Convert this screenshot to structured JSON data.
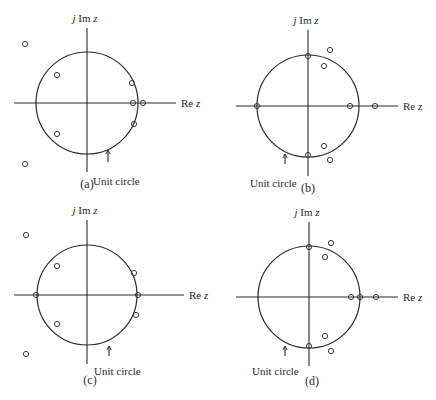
{
  "figure": {
    "panels": [
      {
        "id": "a",
        "caption": "(a)",
        "center": [
          87,
          103
        ],
        "radius": 51,
        "re_axis": [
          14,
          176
        ],
        "im_axis": [
          28,
          172
        ],
        "im_label": "j Im z",
        "re_label": "Re z",
        "unit_circle_label": "Unit circle",
        "unit_circle_label_pos": [
          93,
          176
        ],
        "arrow_x": 108,
        "arrow_y": [
          150,
          162
        ],
        "caption_pos": [
          87,
          188
        ],
        "zeros": [
          [
            25,
            44
          ],
          [
            57,
            75
          ],
          [
            132,
            83
          ],
          [
            133,
            103
          ],
          [
            143,
            103
          ],
          [
            134,
            124
          ],
          [
            57,
            134
          ],
          [
            25,
            164
          ]
        ]
      },
      {
        "id": "b",
        "caption": "(b)",
        "center": [
          308,
          106
        ],
        "radius": 51,
        "re_axis": [
          236,
          398
        ],
        "im_axis": [
          30,
          176
        ],
        "im_label": "j Im z",
        "re_label": "Re z",
        "unit_circle_label": "Unit circle",
        "unit_circle_label_pos": [
          250,
          178
        ],
        "arrow_x": 285,
        "arrow_y": [
          154,
          164
        ],
        "caption_pos": [
          308,
          192
        ],
        "zeros": [
          [
            308,
            56
          ],
          [
            330,
            50
          ],
          [
            324,
            66
          ],
          [
            257,
            106
          ],
          [
            350,
            106
          ],
          [
            375,
            106
          ],
          [
            324,
            146
          ],
          [
            308,
            155
          ],
          [
            330,
            160
          ]
        ]
      },
      {
        "id": "c",
        "caption": "(c)",
        "center": [
          87,
          295
        ],
        "radius": 50,
        "re_axis": [
          14,
          184
        ],
        "im_axis": [
          220,
          364
        ],
        "im_label": "j Im z",
        "re_label": "Re z",
        "unit_circle_label": "Unit circle",
        "unit_circle_label_pos": [
          94,
          366
        ],
        "arrow_x": 109,
        "arrow_y": [
          346,
          356
        ],
        "caption_pos": [
          90,
          384
        ],
        "zeros": [
          [
            26,
            235
          ],
          [
            57,
            266
          ],
          [
            134,
            273
          ],
          [
            36,
            295
          ],
          [
            138,
            295
          ],
          [
            136,
            315
          ],
          [
            57,
            324
          ],
          [
            26,
            354
          ]
        ]
      },
      {
        "id": "d",
        "caption": "(d)",
        "center": [
          309,
          297
        ],
        "radius": 51,
        "re_axis": [
          236,
          398
        ],
        "im_axis": [
          222,
          366
        ],
        "im_label": "j Im z",
        "re_label": "Re z",
        "unit_circle_label": "Unit circle",
        "unit_circle_label_pos": [
          252,
          366
        ],
        "arrow_x": 285,
        "arrow_y": [
          346,
          356
        ],
        "caption_pos": [
          312,
          385
        ],
        "zeros": [
          [
            309,
            247
          ],
          [
            331,
            243
          ],
          [
            325,
            257
          ],
          [
            351,
            297
          ],
          [
            360,
            297
          ],
          [
            376,
            297
          ],
          [
            325,
            336
          ],
          [
            309,
            346
          ],
          [
            331,
            351
          ]
        ]
      }
    ]
  }
}
